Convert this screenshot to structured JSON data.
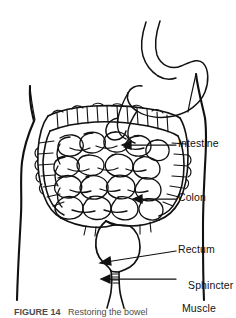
{
  "figure": {
    "kind": "anatomical-line-drawing",
    "background_color": "#ffffff",
    "ink_color": "#111111",
    "width": 236,
    "height": 318
  },
  "labels": [
    {
      "id": "intestine",
      "text": "Intestine",
      "x": 178,
      "y": 139,
      "arrow_y": 145,
      "arrow_tip_x": 122,
      "arrow_start_x": 176,
      "slanted": false
    },
    {
      "id": "colon",
      "text": "Colon",
      "x": 178,
      "y": 193,
      "arrow_y": 199,
      "arrow_tip_x": 133,
      "arrow_start_x": 176,
      "slanted": false
    },
    {
      "id": "rectum",
      "text": "Rectum",
      "x": 178,
      "y": 250,
      "arrow_y": 258,
      "arrow_tip_x": 100,
      "arrow_start_x": 176,
      "slanted": true
    },
    {
      "id": "sphincter-muscle",
      "line1": "Sphincter",
      "line2": "Muscle",
      "x": 178,
      "y": 276,
      "arrow_y": 272,
      "arrow_tip_x": 101,
      "arrow_start_x": 176,
      "slanted": false
    }
  ],
  "caption": {
    "prefix": "FIGURE 14",
    "rest": "   Restoring the bowel",
    "clipped": true
  },
  "parts": {
    "stomach": "stomach",
    "small_intestine": "coiled small intestine",
    "colon": "haustrated large intestine / colon",
    "rectum": "rectum",
    "anal_canal": "anal canal",
    "body_outline": "torso silhouette"
  }
}
